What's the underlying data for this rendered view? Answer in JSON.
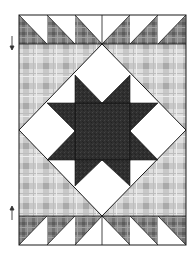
{
  "figure": {
    "title": "",
    "type": "quilt-block-diagram",
    "canvas": {
      "width": 196,
      "height": 255
    },
    "colors": {
      "background": "#ffffff",
      "plaid_light_base": "#dcdcdc",
      "plaid_light_band": "#c4c4c4",
      "plaid_light_cross": "#a8a8a8",
      "plaid_dark_base": "#8a8a8a",
      "plaid_dark_band": "#6e6e6e",
      "plaid_dark_cross": "#5a5a5a",
      "star_fill": "#2e2e2e",
      "seam_line": "#1a1a1a",
      "white_fabric": "#ffffff"
    },
    "quilt": {
      "x": 19,
      "y": 15,
      "width": 167,
      "height": 230
    },
    "top_border_row": {
      "y": 15,
      "height": 29,
      "block_count": 6,
      "left_half_orientation": "plaid-bottom-left",
      "right_half_orientation": "plaid-bottom-right"
    },
    "bottom_border_row": {
      "y": 216,
      "height": 29,
      "block_count": 6,
      "left_half_orientation": "plaid-top-left",
      "right_half_orientation": "plaid-top-right"
    },
    "center_field": {
      "y": 44,
      "height": 172,
      "fabric": "light-plaid"
    },
    "diamond": {
      "top": [
        102,
        44
      ],
      "right": [
        186,
        130
      ],
      "bottom": [
        102,
        216
      ],
      "left": [
        19,
        130
      ],
      "fabric": "white"
    },
    "star": {
      "grid_x": [
        47,
        75,
        130,
        158
      ],
      "grid_y": [
        75,
        103,
        160,
        186
      ],
      "center_square": {
        "x": 75,
        "y": 103,
        "width": 55,
        "height": 57
      },
      "points": 8,
      "fabric": "dark-textured"
    },
    "markers": [
      {
        "name": "down-arrow",
        "x": 12,
        "y1": 36,
        "y2": 50,
        "direction": "down"
      },
      {
        "name": "up-arrow",
        "x": 12,
        "y1": 205,
        "y2": 220,
        "direction": "up"
      }
    ]
  }
}
